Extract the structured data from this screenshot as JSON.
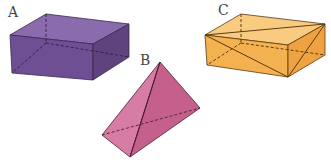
{
  "figure": {
    "shapes": [
      {
        "id": "A",
        "label": "A",
        "kind": "rectangular-prism",
        "color": "#7d5aa0",
        "label_pos": [
          8,
          5
        ]
      },
      {
        "id": "B",
        "label": "B",
        "kind": "tetrahedron",
        "color": "#c8648f",
        "label_pos": [
          140,
          53
        ]
      },
      {
        "id": "C",
        "label": "C",
        "kind": "rectangular-prism-with-diagonals",
        "color": "#f5b356",
        "label_pos": [
          218,
          3
        ]
      }
    ]
  }
}
